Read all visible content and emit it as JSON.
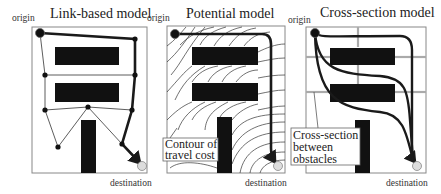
{
  "figure": {
    "panels": [
      {
        "title": "Link-based model",
        "origin_label": "origin",
        "destination_label": "destination"
      },
      {
        "title": "Potential model",
        "origin_label": "origin",
        "destination_label": "destination",
        "callout": [
          "Contour of",
          "travel cost"
        ]
      },
      {
        "title": "Cross-section model",
        "origin_label": "origin",
        "destination_label": "destination",
        "callout": [
          "Cross-section",
          "between",
          "obstacles"
        ]
      }
    ]
  },
  "colors": {
    "obstacle": "#111111",
    "path": "#1a1a1a",
    "frame": "#888888",
    "cross_section_line": "#aaaaaa",
    "destination_fill": "#dddddd"
  }
}
